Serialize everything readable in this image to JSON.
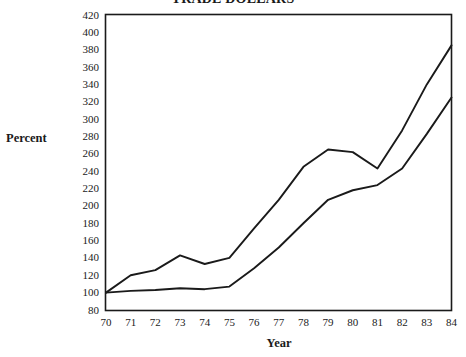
{
  "chart_data": {
    "type": "line",
    "title": "TRADE DOLLARS",
    "xlabel": "Year",
    "ylabel": "Percent",
    "x": [
      70,
      71,
      72,
      73,
      74,
      75,
      76,
      77,
      78,
      79,
      80,
      81,
      82,
      83,
      84
    ],
    "xtick_labels": [
      "70",
      "71",
      "72",
      "73",
      "74",
      "75",
      "76",
      "77",
      "78",
      "79",
      "80",
      "81",
      "82",
      "83",
      "84"
    ],
    "ytick_labels": [
      "420",
      "400",
      "380",
      "360",
      "340",
      "320",
      "300",
      "280",
      "260",
      "240",
      "220",
      "200",
      "180",
      "160",
      "140",
      "120",
      "100",
      "80"
    ],
    "yticks": [
      420,
      400,
      380,
      360,
      340,
      320,
      300,
      280,
      260,
      240,
      220,
      200,
      180,
      160,
      140,
      120,
      100,
      80
    ],
    "xlim": [
      70,
      84
    ],
    "ylim": [
      80,
      420
    ],
    "grid": false,
    "legend": "none",
    "series": [
      {
        "name": "Upper series",
        "color": "#1a1a1a",
        "values": [
          100,
          120,
          126,
          143,
          133,
          140,
          174,
          207,
          245,
          265,
          262,
          243,
          287,
          340,
          385
        ]
      },
      {
        "name": "Lower series",
        "color": "#1a1a1a",
        "values": [
          100,
          102,
          103,
          105,
          104,
          107,
          128,
          152,
          180,
          207,
          218,
          224,
          243,
          283,
          325
        ]
      }
    ]
  }
}
